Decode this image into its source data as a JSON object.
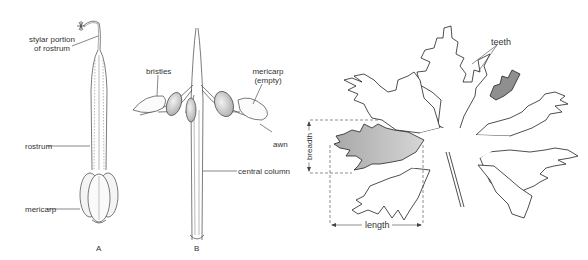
{
  "figure": {
    "panels": [
      {
        "id": "A",
        "letter": "A",
        "description": "Intact fruit with rostrum and mericarps",
        "labels": {
          "stylar": [
            "stylar portion",
            "of rostrum"
          ],
          "rostrum": "rostrum",
          "mericarp": "mericarp"
        }
      },
      {
        "id": "B",
        "letter": "B",
        "description": "Dehisced fruit with mericarps curling back on awns",
        "labels": {
          "bristles": "bristles",
          "mericarp_empty": [
            "mericarp",
            "(empty)"
          ],
          "awn": "awn",
          "central_column": "central column"
        }
      },
      {
        "id": "leaf",
        "description": "Palmately lobed leaf showing measurement of lobe",
        "labels": {
          "teeth": "teeth",
          "breadth": "breadth",
          "length": "length"
        }
      }
    ],
    "colors": {
      "line": "#333333",
      "shade": "#b8b8b8",
      "shade_dark": "#8f8f8f",
      "background": "#ffffff"
    }
  }
}
